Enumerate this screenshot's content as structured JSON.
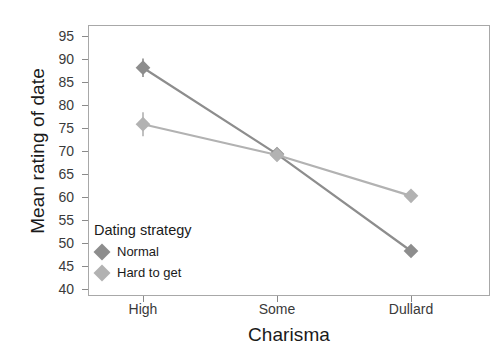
{
  "chart_data": {
    "type": "line",
    "title": "",
    "xlabel": "Charisma",
    "ylabel": "Mean rating of date",
    "categories": [
      "High",
      "Some",
      "Dullard"
    ],
    "ylim": [
      38.5,
      97.5
    ],
    "yticks": [
      40,
      45,
      50,
      55,
      60,
      65,
      70,
      75,
      80,
      85,
      90,
      95
    ],
    "grid": false,
    "legend_position": "inside-bottom-left",
    "legend_title": "Dating strategy",
    "series": [
      {
        "name": "Normal",
        "color": "#8d8d8d",
        "values": [
          88.2,
          69.4,
          48.3
        ],
        "errors": [
          2.0,
          1.2,
          1.0
        ]
      },
      {
        "name": "Hard to get",
        "color": "#b2b2b2",
        "values": [
          75.9,
          69.2,
          60.3
        ],
        "errors": [
          2.6,
          1.2,
          1.0
        ]
      }
    ]
  },
  "axes": {
    "y_tick_labels": [
      "95",
      "90",
      "85",
      "80",
      "75",
      "70",
      "65",
      "60",
      "55",
      "50",
      "45",
      "40"
    ],
    "x_tick_labels": [
      "High",
      "Some",
      "Dullard"
    ]
  },
  "colors": {
    "panel_border": "#a8a8a8",
    "tick": "#8a8a8a",
    "text": "#1a1a1a",
    "tick_text": "#3a3a3a",
    "series_normal": "#8d8d8d",
    "series_hard": "#b2b2b2",
    "background": "#ffffff"
  }
}
